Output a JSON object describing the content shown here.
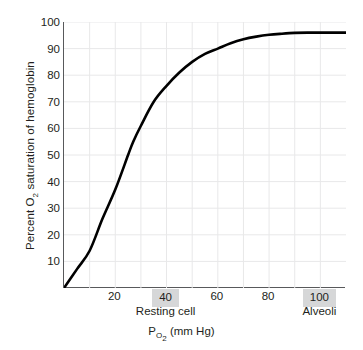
{
  "chart_data": {
    "type": "line",
    "title": "",
    "xlabel": "P O2 (mm Hg)",
    "ylabel": "Percent O2 saturation of hemoglobin",
    "xlim": [
      0,
      110
    ],
    "ylim": [
      0,
      100
    ],
    "grid": true,
    "legend": "none",
    "x_major_ticks": [
      20,
      40,
      60,
      80,
      100
    ],
    "x_minor_gridlines": [
      10,
      20,
      30,
      40,
      50,
      60,
      70,
      80,
      90,
      100
    ],
    "y_ticks": [
      10,
      20,
      30,
      40,
      50,
      60,
      70,
      80,
      90,
      100
    ],
    "series": [
      {
        "name": "Oxygen-hemoglobin dissociation curve",
        "color": "#000000",
        "x": [
          0,
          5,
          10,
          15,
          20,
          25,
          27,
          30,
          35,
          40,
          45,
          50,
          55,
          60,
          65,
          70,
          75,
          80,
          85,
          90,
          95,
          100,
          105,
          110
        ],
        "values": [
          0,
          7,
          14,
          26,
          37,
          50,
          55,
          61,
          70,
          76,
          81,
          85,
          88,
          90,
          92,
          93.5,
          94.5,
          95.2,
          95.6,
          95.9,
          96,
          96,
          96,
          96
        ]
      }
    ],
    "annotations": [
      {
        "label": "Resting cell",
        "x": 40,
        "highlight_color": "#d6d7d8"
      },
      {
        "label": "Alveoli",
        "x": 100,
        "highlight_color": "#d6d7d8"
      }
    ]
  },
  "axes": {
    "y_title_pre": "Percent O",
    "y_title_sub": "2",
    "y_title_post": " saturation of hemoglobin",
    "x_title_pre": "P",
    "x_title_sub": "O",
    "x_title_sub2": "2",
    "x_title_post": " (mm Hg)",
    "y_tick_labels": [
      "100",
      "90",
      "80",
      "70",
      "60",
      "50",
      "40",
      "30",
      "20",
      "10"
    ],
    "x_tick_labels": [
      "20",
      "40",
      "60",
      "80",
      "100"
    ]
  },
  "annotation_labels": {
    "resting_cell": "Resting cell",
    "alveoli": "Alveoli"
  },
  "colors": {
    "curve": "#000000",
    "grid": "#e8e8e9",
    "axis": "#58595b",
    "highlight": "#d6d7d8",
    "text": "#231f20",
    "background": "#ffffff"
  }
}
